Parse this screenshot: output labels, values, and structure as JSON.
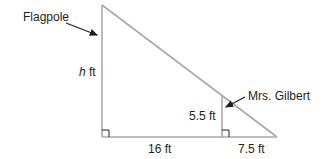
{
  "diagram": {
    "labels": {
      "flagpole": "Flagpole",
      "person": "Mrs. Gilbert",
      "flagpole_height_var": "h",
      "flagpole_height_unit": " ft",
      "person_height": "5.5 ft",
      "base_distance": "16 ft",
      "shadow_distance": "7.5 ft"
    },
    "colors": {
      "line": "#a7a9ac",
      "text": "#231f20",
      "arrow": "#231f20"
    }
  }
}
